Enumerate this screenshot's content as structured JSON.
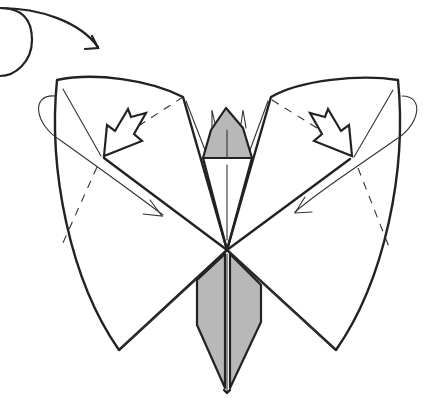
{
  "diagram": {
    "colors": {
      "paper_white": "#ffffff",
      "paper_colored": "#b8b8b8",
      "line": "#222222"
    },
    "symbols": [
      {
        "name": "turn-over-arrow",
        "meaning": "flip model over",
        "position": "top-left"
      },
      {
        "name": "push-arrow-left",
        "meaning": "push / squash fold",
        "position": "left wing"
      },
      {
        "name": "push-arrow-right",
        "meaning": "push / squash fold",
        "position": "right wing"
      },
      {
        "name": "fold-arrow-left",
        "meaning": "fold flap down-right",
        "position": "left wing"
      },
      {
        "name": "fold-arrow-right",
        "meaning": "fold flap down-left",
        "position": "right wing"
      },
      {
        "name": "valley-fold-lines",
        "style": "dashed"
      }
    ],
    "parts": [
      "left-wing",
      "right-wing",
      "head",
      "body"
    ]
  }
}
